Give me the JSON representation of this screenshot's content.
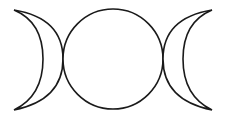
{
  "symbol": {
    "name": "triple moon",
    "stroke_color": "#1a1a1a",
    "fill_color": "#ffffff",
    "parts": [
      "waxing-crescent",
      "full-moon",
      "waning-crescent"
    ]
  }
}
